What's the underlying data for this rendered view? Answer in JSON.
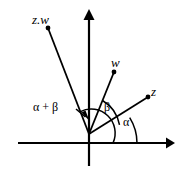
{
  "figure": {
    "background_color": "#ffffff",
    "stroke_color": "#000000",
    "width": 182,
    "height": 174
  },
  "axes": {
    "horizontal": {
      "name": "real-axis",
      "x_start": 18,
      "x_end": 172,
      "y": 143,
      "arrow_at": "right"
    },
    "vertical": {
      "name": "imaginary-axis",
      "x": 89,
      "y_start": 166,
      "y_end": 11,
      "arrow_at": "top"
    }
  },
  "vectors": [
    {
      "id": "zw",
      "label": "z.w",
      "origin": [
        89,
        134
      ],
      "tip": [
        48,
        28
      ],
      "dot": true
    },
    {
      "id": "w",
      "label": "w",
      "origin": [
        89,
        134
      ],
      "tip": [
        114,
        72
      ],
      "dot": true
    },
    {
      "id": "z",
      "label": "z",
      "origin": [
        89,
        134
      ],
      "tip": [
        148,
        97
      ],
      "dot": true
    }
  ],
  "angles": [
    {
      "id": "alpha",
      "label": "α",
      "between": "real-axis and z",
      "arc_radius": 48
    },
    {
      "id": "beta",
      "label": "β",
      "between": "z and w",
      "arc_radius": 36
    },
    {
      "id": "alpha_plus_beta",
      "label": "α + β",
      "between": "real-axis and z.w",
      "arc_radius": 24
    }
  ],
  "annotations": {
    "leader": {
      "name": "alpha-plus-beta-leader",
      "from": [
        77,
        110
      ],
      "to": [
        88,
        120
      ]
    }
  }
}
